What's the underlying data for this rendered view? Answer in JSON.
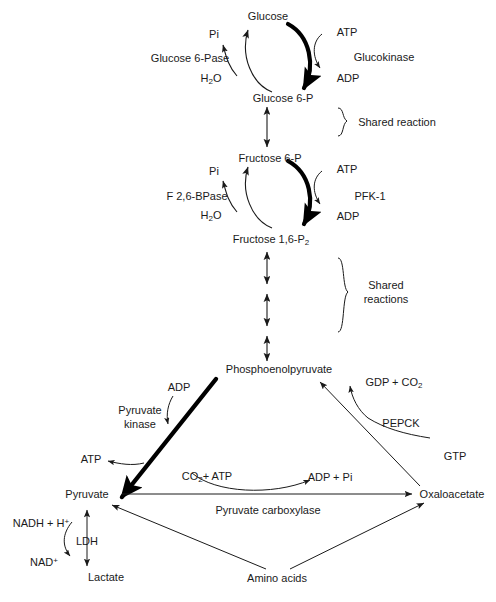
{
  "diagram": {
    "background_color": "#ffffff",
    "line_color": "#1a1a1a",
    "bold_arrow_color": "#000000",
    "text_color": "#1a1a1a"
  },
  "metabolites": {
    "glucose": "Glucose",
    "glucose_6_p": "Glucose 6-P",
    "fructose_6_p": "Fructose 6-P",
    "fructose_1_6_p2_pre": "Fructose 1,6-P",
    "fructose_1_6_p2_sub": "2",
    "pep": "Phosphoenolpyruvate",
    "pyruvate": "Pyruvate",
    "oxaloacetate": "Oxaloacetate",
    "lactate": "Lactate",
    "amino_acids": "Amino acids"
  },
  "enzymes": {
    "glucose_6_pase": "Glucose 6-Pase",
    "glucokinase": "Glucokinase",
    "f_26_bpase": "F 2,6-BPase",
    "pfk1": "PFK-1",
    "pyruvate_kinase_line1": "Pyruvate",
    "pyruvate_kinase_line2": "kinase",
    "pepck": "PEPCK",
    "pyruvate_carboxylase": "Pyruvate carboxylase",
    "ldh": "LDH"
  },
  "cofactors": {
    "pi_top": "Pi",
    "h2o_top_pre": "H",
    "h2o_top_sub": "2",
    "h2o_top_post": "O",
    "atp_top": "ATP",
    "adp_top": "ADP",
    "pi_mid": "Pi",
    "h2o_mid_pre": "H",
    "h2o_mid_sub": "2",
    "h2o_mid_post": "O",
    "atp_mid": "ATP",
    "adp_mid": "ADP",
    "adp_pk": "ADP",
    "atp_pk": "ATP",
    "gdp_co2_pre": "GDP + CO",
    "gdp_co2_sub": "2",
    "gtp": "GTP",
    "co2_atp_pre": "CO",
    "co2_atp_sub": "2",
    "co2_atp_post": "+ ATP",
    "adp_pi": "ADP + Pi",
    "nadh_h_pre": "NADH + H",
    "nadh_h_sup": "+",
    "nad_pre": "NAD",
    "nad_sup": "+"
  },
  "annotations": {
    "shared_reaction": "Shared reaction",
    "shared_reactions_line1": "Shared",
    "shared_reactions_line2": "reactions"
  }
}
